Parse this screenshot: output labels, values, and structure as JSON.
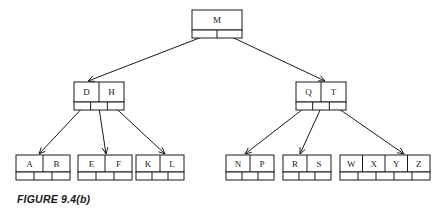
{
  "figure": {
    "caption": "FIGURE 9.4(b)",
    "background_color": "#ffffff",
    "ink_color": "#1a1a1a"
  },
  "diagram": {
    "type": "b-tree",
    "levels": 3,
    "nodes": [
      {
        "id": "root",
        "level": 0,
        "keys": [
          "M"
        ],
        "pointer_cells": 2,
        "x": 192,
        "y": 10,
        "width": 50,
        "key_row_height": 20,
        "ptr_row_height": 8
      },
      {
        "id": "internal-left",
        "level": 1,
        "keys": [
          "D",
          "H"
        ],
        "pointer_cells": 3,
        "x": 74,
        "y": 82,
        "width": 50,
        "key_row_height": 20,
        "ptr_row_height": 8
      },
      {
        "id": "internal-right",
        "level": 1,
        "keys": [
          "Q",
          "T"
        ],
        "pointer_cells": 3,
        "x": 296,
        "y": 82,
        "width": 50,
        "key_row_height": 20,
        "ptr_row_height": 8
      },
      {
        "id": "leaf-ab",
        "level": 2,
        "keys": [
          "A",
          "B"
        ],
        "pointer_cells": 3,
        "x": 16,
        "y": 155,
        "width": 54,
        "key_row_height": 17,
        "ptr_row_height": 8
      },
      {
        "id": "leaf-ef",
        "level": 2,
        "keys": [
          "E",
          "F"
        ],
        "pointer_cells": 3,
        "x": 78,
        "y": 155,
        "width": 54,
        "key_row_height": 17,
        "ptr_row_height": 8
      },
      {
        "id": "leaf-kl",
        "level": 2,
        "keys": [
          "K",
          "L"
        ],
        "pointer_cells": 3,
        "x": 136,
        "y": 155,
        "width": 48,
        "key_row_height": 17,
        "ptr_row_height": 8
      },
      {
        "id": "leaf-np",
        "level": 2,
        "keys": [
          "N",
          "P"
        ],
        "pointer_cells": 3,
        "x": 226,
        "y": 155,
        "width": 48,
        "key_row_height": 17,
        "ptr_row_height": 8
      },
      {
        "id": "leaf-rs",
        "level": 2,
        "keys": [
          "R",
          "S"
        ],
        "pointer_cells": 3,
        "x": 283,
        "y": 155,
        "width": 48,
        "key_row_height": 17,
        "ptr_row_height": 8
      },
      {
        "id": "leaf-wxyz",
        "level": 2,
        "keys": [
          "W",
          "X",
          "Y",
          "Z"
        ],
        "pointer_cells": 5,
        "x": 340,
        "y": 155,
        "width": 90,
        "key_row_height": 17,
        "ptr_row_height": 8
      }
    ],
    "edges": [
      {
        "from": "root",
        "from_slot": 0,
        "to": "internal-left",
        "to_x": 88
      },
      {
        "from": "root",
        "from_slot": 1,
        "to": "internal-right",
        "to_x": 325
      },
      {
        "from": "internal-left",
        "from_slot": 0,
        "to": "leaf-ab",
        "to_x": 39
      },
      {
        "from": "internal-left",
        "from_slot": 1,
        "to": "leaf-ef",
        "to_x": 106
      },
      {
        "from": "internal-left",
        "from_slot": 2,
        "to": "leaf-kl",
        "to_x": 165
      },
      {
        "from": "internal-right",
        "from_slot": 0,
        "to": "leaf-np",
        "to_x": 245
      },
      {
        "from": "internal-right",
        "from_slot": 1,
        "to": "leaf-rs",
        "to_x": 300
      },
      {
        "from": "internal-right",
        "from_slot": 2,
        "to": "leaf-wxyz",
        "to_x": 404
      }
    ]
  }
}
